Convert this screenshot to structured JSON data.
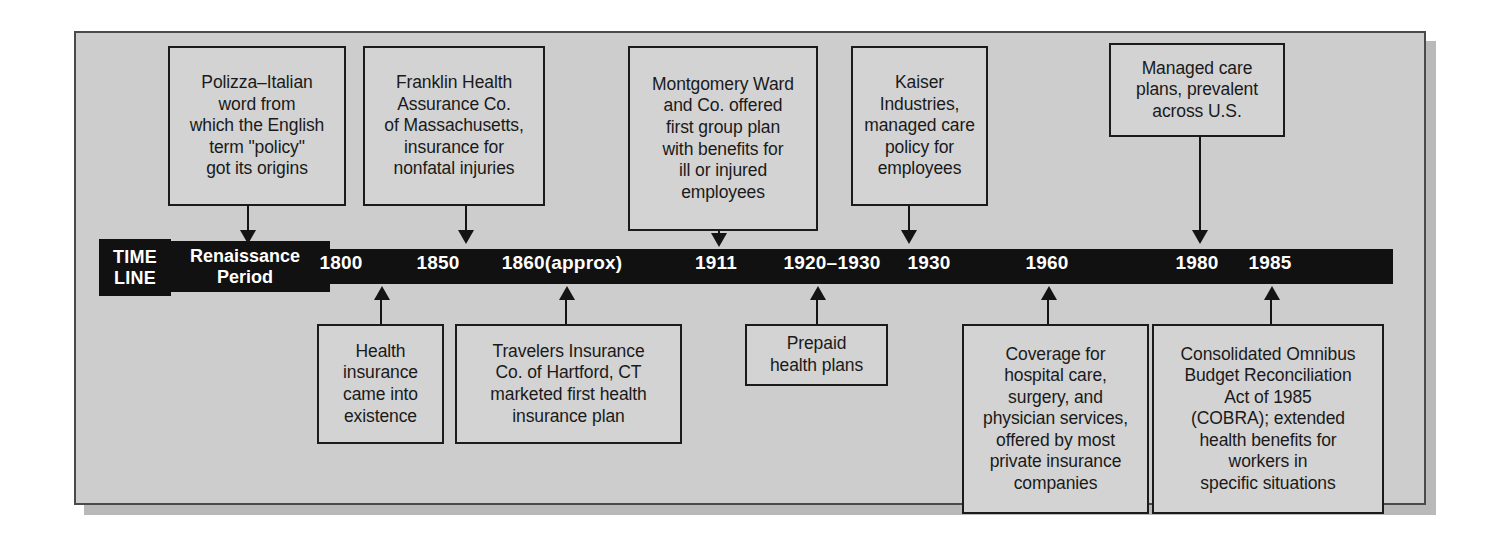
{
  "figure": {
    "kind": "history-timeline",
    "colors": {
      "page_background": "#ffffff",
      "panel_background": "#cdcdcd",
      "panel_border": "#4a4a4a",
      "panel_shadow": "#b9b9b9",
      "box_background": "#d3d3d3",
      "box_border": "#1b1b1b",
      "bar_fill": "#111111",
      "bar_text": "#ffffff",
      "connector": "#141414"
    }
  },
  "timeline": {
    "label_line1": "TIME",
    "label_line2": "LINE",
    "era_line1": "Renaissance",
    "era_line2": "Period",
    "ticks": [
      {
        "label": "1800",
        "x": 341
      },
      {
        "label": "1850",
        "x": 438
      },
      {
        "label": "1860(approx)",
        "x": 562
      },
      {
        "label": "1911",
        "x": 716
      },
      {
        "label": "1920–1930",
        "x": 832
      },
      {
        "label": "1930",
        "x": 929
      },
      {
        "label": "1960",
        "x": 1047
      },
      {
        "label": "1980",
        "x": 1197
      },
      {
        "label": "1985",
        "x": 1270
      }
    ]
  },
  "callouts_above": [
    {
      "id": "polizza",
      "text": "Polizza–Italian\nword from\nwhich the English\nterm \"policy\"\ngot its origins",
      "tick": "Renaissance Period",
      "arrow_x": 248
    },
    {
      "id": "franklin-health",
      "text": "Franklin Health\nAssurance Co.\nof Massachusetts,\ninsurance for\nnonfatal injuries",
      "tick": "1850",
      "arrow_x": 466
    },
    {
      "id": "montgomery-ward",
      "text": "Montgomery Ward\nand Co. offered\nfirst group plan\nwith benefits for\nill or injured\nemployees",
      "tick": "1911",
      "arrow_x": 719
    },
    {
      "id": "kaiser-industries",
      "text": "Kaiser\nIndustries,\nmanaged care\npolicy for\nemployees",
      "tick": "1930",
      "arrow_x": 909
    },
    {
      "id": "managed-care-plans",
      "text": "Managed care\nplans, prevalent\nacross U.S.",
      "tick": "1980",
      "arrow_x": 1200
    }
  ],
  "callouts_below": [
    {
      "id": "health-insurance-existence",
      "text": "Health\ninsurance\ncame into\nexistence",
      "tick": "1800",
      "arrow_x": 381
    },
    {
      "id": "travelers-insurance",
      "text": "Travelers Insurance\nCo. of Hartford, CT\nmarketed first health\ninsurance plan",
      "tick": "1860(approx)",
      "arrow_x": 566
    },
    {
      "id": "prepaid-health-plans",
      "text": "Prepaid\nhealth plans",
      "tick": "1920–1930",
      "arrow_x": 817
    },
    {
      "id": "coverage-hospital-care",
      "text": "Coverage for\nhospital care,\nsurgery, and\nphysician services,\noffered by most\nprivate insurance\ncompanies",
      "tick": "1960",
      "arrow_x": 1048
    },
    {
      "id": "cobra",
      "text": "Consolidated Omnibus\nBudget Reconciliation\nAct of 1985\n(COBRA); extended\nhealth benefits for\nworkers in\nspecific situations",
      "tick": "1985",
      "arrow_x": 1271
    }
  ]
}
